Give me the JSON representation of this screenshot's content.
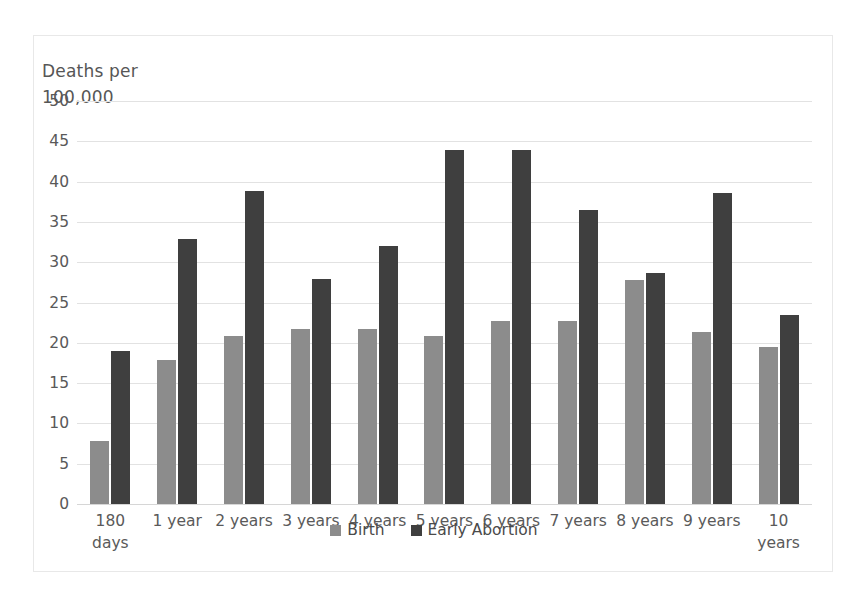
{
  "chart_data": {
    "type": "bar",
    "title": "Deaths per\n100,000",
    "xlabel": "",
    "ylabel": "Deaths per 100,000",
    "ylim": [
      0,
      50
    ],
    "y_ticks": [
      0,
      5,
      10,
      15,
      20,
      25,
      30,
      35,
      40,
      45,
      50
    ],
    "grid": true,
    "legend_position": "bottom",
    "categories": [
      "180\ndays",
      "1 year",
      "2 years",
      "3 years",
      "4 years",
      "5 years",
      "6 years",
      "7 years",
      "8 years",
      "9 years",
      "10\nyears"
    ],
    "series": [
      {
        "name": "Birth",
        "color": "#8c8c8c",
        "values": [
          7.8,
          17.9,
          20.8,
          21.7,
          21.7,
          20.8,
          22.7,
          22.7,
          27.8,
          21.4,
          19.5
        ]
      },
      {
        "name": "Early Abortion",
        "color": "#3f3f3f",
        "values": [
          19.0,
          32.9,
          38.8,
          27.9,
          32.0,
          43.9,
          43.9,
          36.5,
          28.6,
          38.6,
          23.4
        ]
      }
    ]
  }
}
